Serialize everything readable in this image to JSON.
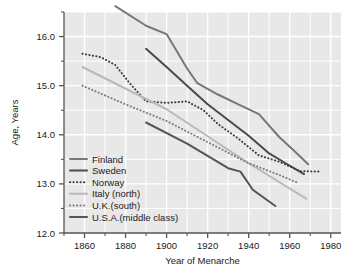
{
  "chart_data": {
    "type": "line",
    "title": "",
    "xlabel": "Year of Menarche",
    "ylabel": "Age, Years",
    "xlim": [
      1850,
      1985
    ],
    "ylim": [
      12.0,
      16.5
    ],
    "grid": true,
    "legend_position": "lower-left-inside",
    "xticks": [
      1860,
      1880,
      1900,
      1920,
      1940,
      1960,
      1980
    ],
    "xtick_labels": [
      "1860",
      "1880",
      "1900",
      "1920",
      "1940",
      "1960",
      "1980"
    ],
    "xminor_ticks": [
      1850,
      1870,
      1890,
      1910,
      1930,
      1950,
      1970
    ],
    "yticks": [
      12.0,
      13.0,
      14.0,
      15.0,
      16.0
    ],
    "ytick_labels": [
      "12.0",
      "13.0",
      "14.0",
      "15.0",
      "16.0"
    ],
    "yminor_ticks": [
      12.5,
      13.5,
      14.5,
      15.5,
      16.5
    ],
    "plot_bg": "#e8e8e8",
    "grid_color": "#ffffff",
    "axis_color": "#555555",
    "series": [
      {
        "name": "Finland",
        "style": "solid",
        "color": "#777777",
        "width": 2.0,
        "x": [
          1875,
          1890,
          1900,
          1910,
          1915,
          1925,
          1935,
          1945,
          1955,
          1962,
          1969
        ],
        "y": [
          16.62,
          16.22,
          16.05,
          15.35,
          15.05,
          14.82,
          14.62,
          14.42,
          13.95,
          13.68,
          13.4
        ]
      },
      {
        "name": "Sweden",
        "style": "solid",
        "color": "#4a4a4a",
        "width": 2.0,
        "x": [
          1890,
          1900,
          1910,
          1920,
          1930,
          1940,
          1950,
          1958,
          1967
        ],
        "y": [
          15.75,
          15.38,
          15.0,
          14.62,
          14.3,
          13.98,
          13.62,
          13.42,
          13.2
        ]
      },
      {
        "name": "Norway",
        "style": "dotted",
        "color": "#3a3a3a",
        "width": 2.0,
        "x": [
          1859,
          1868,
          1875,
          1882,
          1890,
          1900,
          1910,
          1918,
          1925,
          1935,
          1945,
          1955,
          1965,
          1975
        ],
        "y": [
          15.65,
          15.58,
          15.42,
          15.05,
          14.68,
          14.65,
          14.68,
          14.5,
          14.22,
          13.92,
          13.58,
          13.45,
          13.26,
          13.25
        ]
      },
      {
        "name": "Italy (north)",
        "style": "solid",
        "color": "#b9b9b9",
        "width": 2.0,
        "x": [
          1859,
          1900,
          1940,
          1968
        ],
        "y": [
          15.38,
          14.52,
          13.42,
          12.7
        ]
      },
      {
        "name": "U.K.(south)",
        "style": "dotted",
        "color": "#7d7d7d",
        "width": 2.0,
        "x": [
          1859,
          1880,
          1900,
          1920,
          1940,
          1955,
          1964
        ],
        "y": [
          15.0,
          14.62,
          14.28,
          13.85,
          13.42,
          13.18,
          13.02
        ]
      },
      {
        "name": "U.S.A.(middle class)",
        "style": "solid",
        "color": "#555555",
        "width": 2.0,
        "x": [
          1890,
          1910,
          1930,
          1936,
          1942,
          1953
        ],
        "y": [
          14.25,
          13.82,
          13.32,
          13.25,
          12.88,
          12.55
        ]
      }
    ]
  },
  "legend": {
    "entries": [
      {
        "label": "Finland"
      },
      {
        "label": "Sweden"
      },
      {
        "label": "Norway"
      },
      {
        "label": "Italy (north)"
      },
      {
        "label": "U.K.(south)"
      },
      {
        "label": "U.S.A.(middle class)"
      }
    ]
  }
}
